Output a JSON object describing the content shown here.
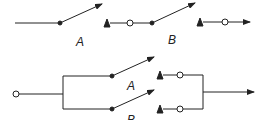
{
  "diagram": {
    "series": {
      "switch_a_label": "A",
      "switch_b_label": "B"
    },
    "parallel": {
      "switch_a_label": "A",
      "switch_b_label": "B"
    },
    "colors": {
      "line": "#222222",
      "background": "#ffffff"
    }
  }
}
